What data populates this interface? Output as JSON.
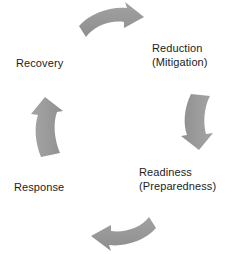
{
  "diagram": {
    "type": "cycle",
    "direction": "clockwise",
    "background_color": "#ffffff",
    "arrow_color": "#9a9a9a",
    "text_color": "#1c1c1c",
    "stages": [
      {
        "id": "reduction",
        "line1": "Reduction",
        "line2": "(Mitigation)",
        "text": "Reduction\n(Mitigation)",
        "position": "top-right"
      },
      {
        "id": "readiness",
        "line1": "Readiness",
        "line2": "(Preparedness)",
        "text": "Readiness\n(Preparedness)",
        "position": "bottom-right"
      },
      {
        "id": "response",
        "line1": "Response",
        "line2": "",
        "text": "Response",
        "position": "bottom-left"
      },
      {
        "id": "recovery",
        "line1": "Recovery",
        "line2": "",
        "text": "Recovery",
        "position": "top-left"
      }
    ],
    "arrows": [
      {
        "id": "arrow-top",
        "name": "arrow-recovery-to-reduction",
        "direction": "right"
      },
      {
        "id": "arrow-right",
        "name": "arrow-reduction-to-readiness",
        "direction": "down"
      },
      {
        "id": "arrow-bottom",
        "name": "arrow-readiness-to-response",
        "direction": "left"
      },
      {
        "id": "arrow-left",
        "name": "arrow-response-to-recovery",
        "direction": "up"
      }
    ]
  }
}
